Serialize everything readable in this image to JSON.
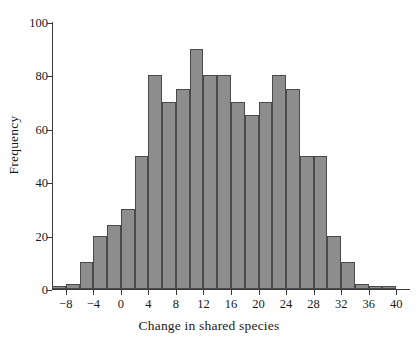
{
  "chart_data": {
    "type": "bar",
    "title": "",
    "xlabel": "Change in shared species",
    "ylabel": "Frequency",
    "grid": false,
    "legend": null,
    "bin_width": 2,
    "xlim": [
      -10,
      42
    ],
    "ylim": [
      0,
      100
    ],
    "x_ticks": [
      "−8",
      "−4",
      "0",
      "4",
      "8",
      "12",
      "16",
      "20",
      "24",
      "28",
      "32",
      "36",
      "40"
    ],
    "x_tick_values": [
      -8,
      -4,
      0,
      4,
      8,
      12,
      16,
      20,
      24,
      28,
      32,
      36,
      40
    ],
    "y_ticks": [
      "0",
      "20",
      "40",
      "60",
      "80",
      "100"
    ],
    "y_tick_values": [
      0,
      20,
      40,
      60,
      80,
      100
    ],
    "bin_starts": [
      -10,
      -8,
      -6,
      -4,
      -2,
      0,
      2,
      4,
      6,
      8,
      10,
      12,
      14,
      16,
      18,
      20,
      22,
      24,
      26,
      28,
      30,
      32,
      34,
      36,
      38
    ],
    "categories": [
      "-10",
      "-8",
      "-6",
      "-4",
      "-2",
      "0",
      "2",
      "4",
      "6",
      "8",
      "10",
      "12",
      "14",
      "16",
      "18",
      "20",
      "22",
      "24",
      "26",
      "28",
      "30",
      "32",
      "34",
      "36",
      "38"
    ],
    "values": [
      1,
      2,
      10,
      20,
      24,
      30,
      50,
      80,
      70,
      75,
      90,
      80,
      80,
      70,
      65,
      70,
      80,
      75,
      50,
      50,
      20,
      10,
      2,
      1,
      1
    ],
    "bar_color": "#8d8d8d",
    "bar_edge_color": "#4a4a4a",
    "axis_color": "#3a3a3a",
    "background_color": "#ffffff"
  }
}
